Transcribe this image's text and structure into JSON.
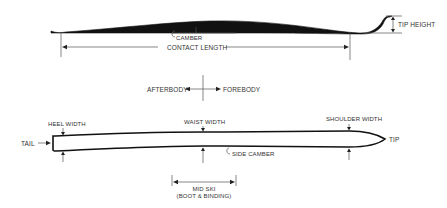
{
  "diagram": {
    "side_view": {
      "labels": {
        "camber": "CAMBER",
        "contact_length": "CONTACT LENGTH",
        "tip_height": "TIP HEIGHT"
      }
    },
    "direction": {
      "afterbody": "AFTERBODY",
      "forebody": "FOREBODY"
    },
    "top_view": {
      "labels": {
        "tail": "TAIL",
        "tip": "TIP",
        "heel_width": "HEEL WIDTH",
        "waist_width": "WAIST WIDTH",
        "shoulder_width": "SHOULDER WIDTH",
        "side_camber": "SIDE CAMBER",
        "mid_ski": "MID SKI",
        "mid_ski_sub": "(BOOT & BINDING)"
      }
    },
    "colors": {
      "ink": "#1a1a1a",
      "line": "#555555",
      "background": "#ffffff"
    }
  }
}
